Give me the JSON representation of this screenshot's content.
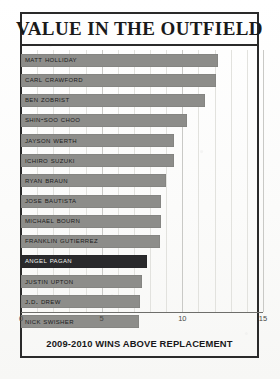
{
  "chart_data": {
    "type": "bar",
    "orientation": "horizontal",
    "title": "VALUE IN THE OUTFIELD",
    "caption": "2009-2010 WINS ABOVE REPLACEMENT",
    "xlabel": "2009-2010 WINS ABOVE REPLACEMENT",
    "ylabel": "",
    "xlim": [
      0,
      15
    ],
    "xticks": [
      0,
      5,
      10,
      15
    ],
    "xtick_labels": [
      "0",
      "5",
      "10",
      "15"
    ],
    "grid": true,
    "legend": "none",
    "highlight_category": "Angel Pagan",
    "categories": [
      "Matt Holliday",
      "Carl Crawford",
      "Ben Zobrist",
      "Shin-Soo Choo",
      "Jayson Werth",
      "Ichiro Suzuki",
      "Ryan Braun",
      "Jose Bautista",
      "Michael Bourn",
      "Franklin Gutierrez",
      "Angel Pagan",
      "Justin Upton",
      "J.D. Drew",
      "Nick Swisher"
    ],
    "values": [
      12.2,
      12.1,
      11.4,
      10.3,
      9.5,
      9.5,
      9.0,
      8.7,
      8.7,
      8.6,
      7.8,
      7.5,
      7.4,
      7.3
    ],
    "bars": [
      {
        "label": "Matt Holliday",
        "value": 12.2,
        "highlighted": false
      },
      {
        "label": "Carl Crawford",
        "value": 12.1,
        "highlighted": false
      },
      {
        "label": "Ben Zobrist",
        "value": 11.4,
        "highlighted": false
      },
      {
        "label": "Shin-Soo Choo",
        "value": 10.3,
        "highlighted": false
      },
      {
        "label": "Jayson Werth",
        "value": 9.5,
        "highlighted": false
      },
      {
        "label": "Ichiro Suzuki",
        "value": 9.5,
        "highlighted": false
      },
      {
        "label": "Ryan Braun",
        "value": 9.0,
        "highlighted": false
      },
      {
        "label": "Jose Bautista",
        "value": 8.7,
        "highlighted": false
      },
      {
        "label": "Michael Bourn",
        "value": 8.7,
        "highlighted": false
      },
      {
        "label": "Franklin Gutierrez",
        "value": 8.6,
        "highlighted": false
      },
      {
        "label": "Angel Pagan",
        "value": 7.8,
        "highlighted": true
      },
      {
        "label": "Justin Upton",
        "value": 7.5,
        "highlighted": false
      },
      {
        "label": "J.D. Drew",
        "value": 7.4,
        "highlighted": false
      },
      {
        "label": "Nick Swisher",
        "value": 7.3,
        "highlighted": false
      }
    ],
    "colors": {
      "bar": "#8d8d8a",
      "bar_highlight": "#2a2a2c",
      "border": "#2a2a2a",
      "background": "#fdfdfc",
      "gridline": "#c9c9c6",
      "text": "#1b1b1b"
    }
  }
}
